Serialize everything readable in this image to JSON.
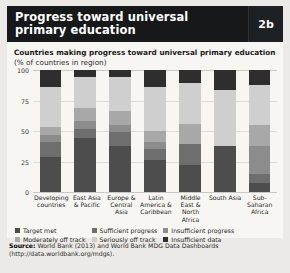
{
  "header": {
    "title_line1": "Progress toward universal",
    "title_line2": "primary education",
    "badge": "2b"
  },
  "panel": {
    "subtitle_line1": "Countries making progress toward universal primary education",
    "subtitle_line2": "(% of countries in region)"
  },
  "source": {
    "label": "Source:",
    "text": "World Bank (2013) and World Bank MDG Data Dashboards",
    "url_line": "(http://data.worldbank.org/mdgs)."
  },
  "legend": {
    "col1": [
      {
        "label": "Target met",
        "color": "#4d4d4d"
      },
      {
        "label": "Moderately off track",
        "color": "#a8a8a8"
      }
    ],
    "col2": [
      {
        "label": "Sufficient progress",
        "color": "#6e6e6e"
      },
      {
        "label": "Seriously off track",
        "color": "#cfcfcf"
      }
    ],
    "col3": [
      {
        "label": "Insufficient progress",
        "color": "#8c8c8c"
      },
      {
        "label": "Insufficient data",
        "color": "#2e2e2e"
      }
    ]
  },
  "chart_data": {
    "type": "bar",
    "title": "Countries making progress toward universal primary education",
    "subtitle": "(% of countries in region)",
    "stacked": true,
    "xlabel": "",
    "ylabel": "% of countries in region",
    "ylim": [
      0,
      100
    ],
    "yticks": [
      0,
      25,
      50,
      75,
      100
    ],
    "grid": true,
    "legend_position": "bottom",
    "categories": [
      "Developing countries",
      "East Asia & Pacific",
      "Europe & Central Asia",
      "Latin America & Caribbean",
      "Middle East & North Africa",
      "South Asia",
      "Sub-Saharan Africa"
    ],
    "series": [
      {
        "name": "Target met",
        "color": "#4d4d4d",
        "values": [
          29,
          44,
          38,
          26,
          22,
          38,
          7
        ]
      },
      {
        "name": "Sufficient progress",
        "color": "#6e6e6e",
        "values": [
          12,
          8,
          11,
          9,
          17,
          0,
          8
        ]
      },
      {
        "name": "Insufficient progress",
        "color": "#8c8c8c",
        "values": [
          6,
          6,
          6,
          6,
          0,
          0,
          23
        ]
      },
      {
        "name": "Moderately off track",
        "color": "#a8a8a8",
        "values": [
          6,
          11,
          11,
          9,
          17,
          0,
          17
        ]
      },
      {
        "name": "Seriously off track",
        "color": "#cfcfcf",
        "values": [
          33,
          25,
          28,
          36,
          33,
          46,
          33
        ]
      },
      {
        "name": "Insufficient data",
        "color": "#2e2e2e",
        "values": [
          14,
          6,
          6,
          14,
          11,
          16,
          12
        ]
      }
    ]
  }
}
